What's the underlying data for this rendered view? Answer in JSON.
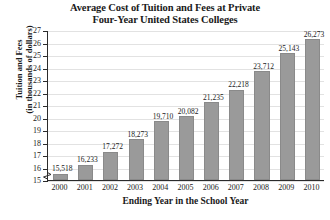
{
  "chart_data": {
    "type": "bar",
    "title": "Average Cost of Tuition and Fees at Private Four-Year United States Colleges",
    "title_lines": [
      "Average Cost of Tuition and Fees at Private",
      "Four-Year United States Colleges"
    ],
    "xlabel": "Ending Year in the School Year",
    "ylabel": "Tuition and Fees (in thousands of dollars)",
    "ylabel_lines": [
      "Tuition and Fees",
      "(in thousands of dollars)"
    ],
    "categories": [
      "2000",
      "2001",
      "2002",
      "2003",
      "2004",
      "2005",
      "2006",
      "2007",
      "2008",
      "2009",
      "2010"
    ],
    "values": [
      15518,
      16233,
      17272,
      18273,
      19710,
      20082,
      21235,
      22218,
      23712,
      25143,
      26273
    ],
    "value_labels": [
      "15,518",
      "16,233",
      "17,272",
      "18,273",
      "19,710",
      "20,082",
      "21,235",
      "22,218",
      "23,712",
      "25,143",
      "26,273"
    ],
    "ylim": [
      15000,
      27000
    ],
    "ytick_values": [
      15000,
      16000,
      17000,
      18000,
      19000,
      20000,
      21000,
      22000,
      23000,
      24000,
      25000,
      26000,
      27000
    ],
    "ytick_labels": [
      "15",
      "16",
      "17",
      "18",
      "19",
      "20",
      "21",
      "22",
      "23",
      "24",
      "25",
      "26",
      "27"
    ],
    "grid": true,
    "legend": false,
    "axis_break": true,
    "bar_color": "#9a9a9a",
    "grid_color": "#e2e2e2",
    "axis_color": "#2b2b2b"
  }
}
